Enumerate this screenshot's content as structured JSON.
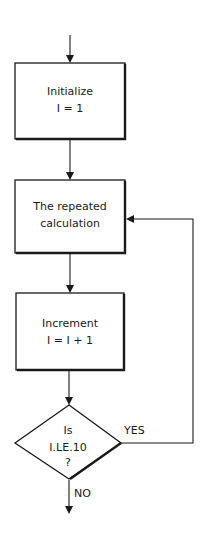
{
  "flowchart": {
    "nodes": [
      {
        "id": "init",
        "type": "process",
        "lines": [
          "Initialize",
          "I = 1"
        ]
      },
      {
        "id": "calc",
        "type": "process",
        "lines": [
          "The repeated",
          "calculation"
        ]
      },
      {
        "id": "incr",
        "type": "process",
        "lines": [
          "Increment",
          "I = I + 1"
        ]
      },
      {
        "id": "test",
        "type": "decision",
        "lines": [
          "Is",
          "I.LE.10",
          "?"
        ]
      }
    ],
    "edges": [
      {
        "from": "start",
        "to": "init",
        "label": ""
      },
      {
        "from": "init",
        "to": "calc",
        "label": ""
      },
      {
        "from": "calc",
        "to": "incr",
        "label": ""
      },
      {
        "from": "incr",
        "to": "test",
        "label": ""
      },
      {
        "from": "test",
        "to": "calc",
        "label": "YES"
      },
      {
        "from": "test",
        "to": "end",
        "label": "NO"
      }
    ],
    "labels": {
      "yes": "YES",
      "no": "NO"
    }
  }
}
